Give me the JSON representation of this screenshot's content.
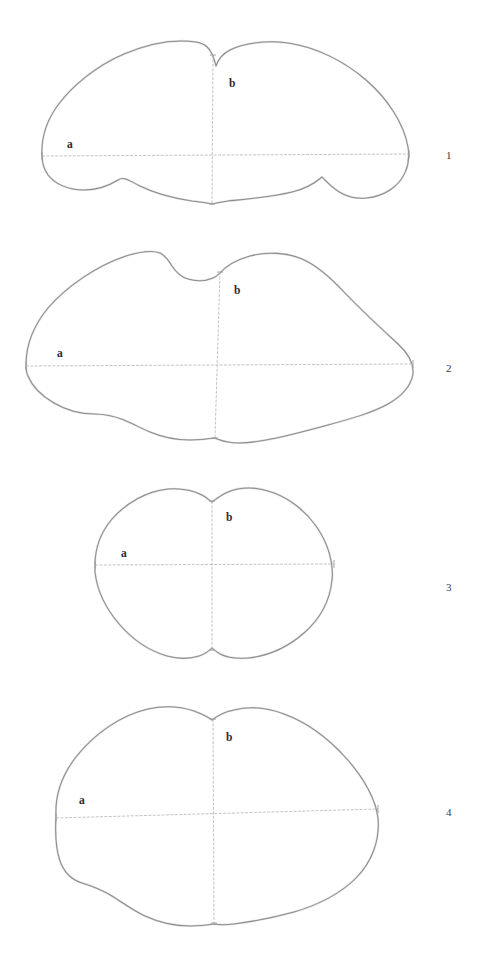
{
  "plate": {
    "background_color": "#ffffff",
    "ink_color": "#8e8e90",
    "axis_color": "#b4b4b6",
    "label_color": "#2b2b2b",
    "description": "Plate of four outline drawings of seed/grain cross-sections, each with transverse axis a and vertical axis b"
  },
  "figures": [
    {
      "number": "1",
      "axis_a_label": "a",
      "axis_b_label": "b",
      "outline_path": "M 42 156 C 41 138 47 120 58 105 C 72 86 96 66 124 54 C 150 43 176 39 196 42 C 206 44 209 48 212 54 C 214 58 215 62 216 66 C 218 60 222 54 230 50 C 244 43 266 40 288 43 C 316 47 344 61 366 80 C 388 99 404 124 408 147 C 411 165 404 181 390 190 C 376 199 357 201 343 194 C 334 190 328 183 322 177 C 315 183 305 189 292 192 C 272 197 248 199 228 201 C 221 202 216 203 212 204 C 207 203 200 202 192 201 C 172 198 152 192 140 186 C 130 181 124 176 118 180 C 110 185 98 190 84 190 C 68 190 55 184 48 175 C 44 169 42 163 42 156 Z",
      "axis_a": {
        "x1": 42,
        "y1": 156,
        "x2": 409,
        "y2": 154
      },
      "axis_b": {
        "x1": 213,
        "y1": 55,
        "x2": 212,
        "y2": 204
      },
      "label_a_pos": {
        "x": 67,
        "y": 148
      },
      "label_b_pos": {
        "x": 229,
        "y": 87
      }
    },
    {
      "number": "2",
      "axis_a_label": "a",
      "axis_b_label": "b",
      "outline_path": "M 26 365 C 26 345 34 325 48 308 C 66 287 96 266 126 256 C 142 251 152 250 160 253 C 166 256 169 261 172 266 C 176 272 180 277 188 279 C 198 282 206 281 213 278 C 216 277 218 275 220 273 C 226 266 236 260 250 256 C 268 251 288 253 302 259 C 316 265 330 277 344 292 C 362 311 384 331 398 344 C 410 355 414 364 413 374 C 411 386 402 396 388 404 C 372 413 350 419 328 425 C 306 431 284 437 266 440 C 250 443 238 444 228 442 C 222 441 218 439 214 438 C 208 439 200 440 190 440 C 176 440 162 437 150 432 C 140 428 132 423 124 420 C 114 416 104 414 94 414 C 80 414 66 410 54 403 C 42 396 32 386 28 376 C 26 372 26 368 26 365 Z",
      "axis_a": {
        "x1": 26,
        "y1": 366,
        "x2": 413,
        "y2": 364
      },
      "axis_b": {
        "x1": 220,
        "y1": 272,
        "x2": 215,
        "y2": 438
      },
      "label_a_pos": {
        "x": 57,
        "y": 357
      },
      "label_b_pos": {
        "x": 234,
        "y": 294
      }
    },
    {
      "number": "3",
      "axis_a_label": "a",
      "axis_b_label": "b",
      "outline_path": "M 95 565 C 95 548 101 532 112 519 C 126 503 147 491 168 489 C 182 488 194 491 202 495 C 206 497 209 500 212 502 C 216 499 221 495 228 492 C 240 487 255 487 268 491 C 286 496 304 509 316 526 C 328 543 334 563 332 580 C 330 600 320 619 304 633 C 288 647 268 656 248 658 C 236 659 226 657 220 654 C 217 652 214 650 212 648 C 209 651 205 654 199 656 C 190 659 178 659 167 656 C 150 651 133 640 120 625 C 106 609 97 590 95 572 C 95 570 95 567 95 565 Z",
      "axis_a": {
        "x1": 95,
        "y1": 565,
        "x2": 334,
        "y2": 564
      },
      "axis_b": {
        "x1": 212,
        "y1": 501,
        "x2": 212,
        "y2": 650
      },
      "label_a_pos": {
        "x": 121,
        "y": 557
      },
      "label_b_pos": {
        "x": 226,
        "y": 521
      }
    },
    {
      "number": "4",
      "axis_a_label": "a",
      "axis_b_label": "b",
      "outline_path": "M 56 816 C 55 796 62 775 76 757 C 94 734 121 715 148 709 C 166 705 182 707 194 711 C 202 714 208 717 212 720 C 217 716 224 712 234 710 C 250 706 268 708 284 714 C 306 722 328 738 346 758 C 364 778 376 800 378 818 C 380 840 372 862 356 878 C 340 894 318 905 294 912 C 272 918 250 922 234 924 C 226 925 219 925 214 924 C 208 925 200 926 190 926 C 174 926 158 922 145 916 C 132 910 122 902 112 896 C 102 890 92 886 82 883 C 72 880 64 872 60 861 C 56 850 55 834 56 816 Z",
      "axis_a": {
        "x1": 56,
        "y1": 818,
        "x2": 378,
        "y2": 809
      },
      "axis_b": {
        "x1": 213,
        "y1": 719,
        "x2": 214,
        "y2": 923
      },
      "label_a_pos": {
        "x": 79,
        "y": 804
      },
      "label_b_pos": {
        "x": 226,
        "y": 741
      }
    }
  ],
  "figure_number_positions": [
    {
      "x": 446,
      "y": 149
    },
    {
      "x": 446,
      "y": 362
    },
    {
      "x": 446,
      "y": 581
    },
    {
      "x": 446,
      "y": 806
    }
  ]
}
